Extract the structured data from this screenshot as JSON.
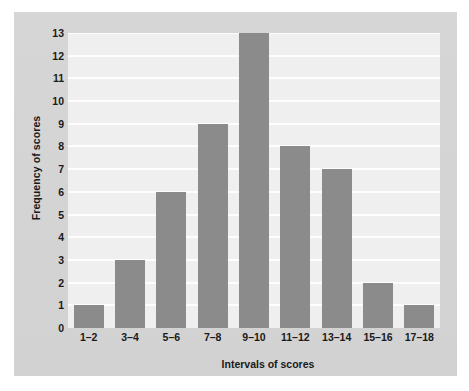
{
  "chart_data": {
    "type": "bar",
    "title": "",
    "subtitle": "",
    "xlabel": "Intervals of scores",
    "ylabel": "Frequency of scores",
    "categories": [
      "1–2",
      "3–4",
      "5–6",
      "7–8",
      "9–10",
      "11–12",
      "13–14",
      "15–16",
      "17–18"
    ],
    "values": [
      1,
      3,
      6,
      9,
      13,
      8,
      7,
      2,
      1
    ],
    "ylim": [
      0,
      13
    ],
    "yticks": [
      0,
      1,
      2,
      3,
      4,
      5,
      6,
      7,
      8,
      9,
      10,
      11,
      12,
      13
    ],
    "ytick_labels": [
      "0",
      "1",
      "2",
      "3",
      "4",
      "5",
      "6",
      "7",
      "8",
      "9",
      "10",
      "11",
      "12",
      "13"
    ],
    "grid": "horizontal",
    "legend": "none",
    "annotations": [],
    "colors": {
      "bar": "#8b8b8b",
      "plot_background": "#efefef",
      "gridline": "#fdfdfd",
      "panel_background": "#d4d4d4",
      "page_background": "#ffffff",
      "text": "#1a1a1a"
    }
  }
}
